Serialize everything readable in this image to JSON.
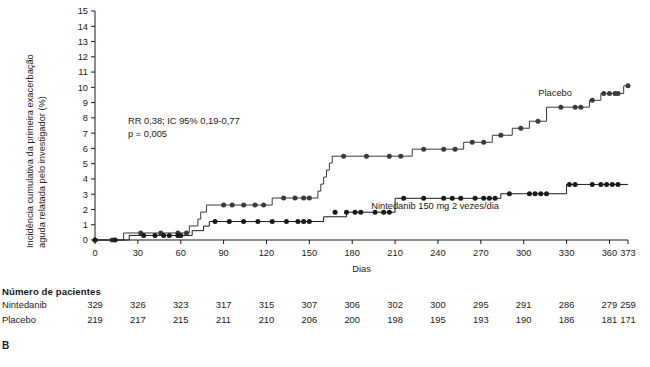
{
  "panel": {
    "letter": "B"
  },
  "axes": {
    "y_label_line1": "Incidência cumulativa da primeira exacerbação",
    "y_label_line2": "aguda relatada pelo investigador (%)",
    "x_label": "Dias"
  },
  "annotation": {
    "line1": "RR 0,38; IC 95% 0,19-0,77",
    "line2": "p = 0,005"
  },
  "series_labels": {
    "placebo": "Placebo",
    "nintedanib": "Nintedanib 150 mg 2 vezes/dia"
  },
  "risk_table": {
    "title": "Número de pacientes",
    "rows": [
      {
        "label": "Nintedanib",
        "values": [
          "329",
          "326",
          "323",
          "317",
          "315",
          "307",
          "306",
          "302",
          "300",
          "295",
          "291",
          "286",
          "279",
          "259"
        ]
      },
      {
        "label": "Placebo",
        "values": [
          "219",
          "217",
          "215",
          "211",
          "210",
          "206",
          "200",
          "198",
          "195",
          "193",
          "190",
          "186",
          "181",
          "171"
        ]
      }
    ]
  },
  "chart_data": {
    "type": "line",
    "title": "",
    "xlabel": "Dias",
    "ylabel": "Incidência cumulativa da primeira exacerbação aguda relatada pelo investigador (%)",
    "xlim": [
      0,
      373
    ],
    "ylim": [
      0,
      15
    ],
    "xticks": [
      0,
      30,
      60,
      90,
      120,
      150,
      180,
      210,
      240,
      270,
      300,
      330,
      360,
      373
    ],
    "xtick_labels": [
      "0",
      "30",
      "60",
      "90",
      "120",
      "150",
      "180",
      "210",
      "240",
      "270",
      "300",
      "330",
      "360",
      "373"
    ],
    "yticks": [
      0,
      1,
      2,
      3,
      4,
      5,
      6,
      7,
      8,
      9,
      10,
      11,
      12,
      13,
      14,
      15
    ],
    "ytick_labels": [
      "0",
      "1",
      "2",
      "3",
      "4",
      "5",
      "6",
      "7",
      "8",
      "9",
      "10",
      "11",
      "12",
      "13",
      "14",
      "15"
    ],
    "grid": false,
    "legend_position": "inline-annotation",
    "series": [
      {
        "name": "Placebo",
        "color": "#3a3a3a",
        "step": "post",
        "label_at": {
          "x": 322,
          "y": 9.4
        },
        "points": [
          [
            0,
            0.0
          ],
          [
            12,
            0.0
          ],
          [
            20,
            0.46
          ],
          [
            32,
            0.46
          ],
          [
            46,
            0.46
          ],
          [
            58,
            0.46
          ],
          [
            64,
            0.46
          ],
          [
            66,
            0.92
          ],
          [
            70,
            0.92
          ],
          [
            72,
            1.37
          ],
          [
            74,
            1.83
          ],
          [
            78,
            2.29
          ],
          [
            96,
            2.29
          ],
          [
            118,
            2.29
          ],
          [
            124,
            2.75
          ],
          [
            140,
            2.75
          ],
          [
            150,
            2.75
          ],
          [
            156,
            3.2
          ],
          [
            158,
            3.66
          ],
          [
            160,
            4.12
          ],
          [
            162,
            4.58
          ],
          [
            164,
            5.04
          ],
          [
            166,
            5.49
          ],
          [
            178,
            5.49
          ],
          [
            196,
            5.49
          ],
          [
            214,
            5.49
          ],
          [
            222,
            5.95
          ],
          [
            236,
            5.95
          ],
          [
            252,
            5.95
          ],
          [
            258,
            6.4
          ],
          [
            266,
            6.4
          ],
          [
            272,
            6.4
          ],
          [
            278,
            6.86
          ],
          [
            288,
            6.86
          ],
          [
            292,
            7.32
          ],
          [
            300,
            7.32
          ],
          [
            304,
            7.78
          ],
          [
            312,
            7.78
          ],
          [
            316,
            8.7
          ],
          [
            330,
            8.7
          ],
          [
            340,
            8.7
          ],
          [
            346,
            9.15
          ],
          [
            350,
            9.15
          ],
          [
            354,
            9.6
          ],
          [
            358,
            9.6
          ],
          [
            362,
            9.6
          ],
          [
            366,
            9.6
          ],
          [
            370,
            10.1
          ],
          [
            373,
            10.1
          ]
        ],
        "markers": [
          [
            0,
            0.0
          ],
          [
            12,
            0.0
          ],
          [
            32,
            0.46
          ],
          [
            46,
            0.46
          ],
          [
            58,
            0.46
          ],
          [
            64,
            0.46
          ],
          [
            90,
            2.29
          ],
          [
            96,
            2.29
          ],
          [
            104,
            2.29
          ],
          [
            112,
            2.29
          ],
          [
            118,
            2.29
          ],
          [
            132,
            2.75
          ],
          [
            140,
            2.75
          ],
          [
            146,
            2.75
          ],
          [
            150,
            2.75
          ],
          [
            174,
            5.49
          ],
          [
            190,
            5.49
          ],
          [
            206,
            5.49
          ],
          [
            214,
            5.49
          ],
          [
            230,
            5.95
          ],
          [
            244,
            5.95
          ],
          [
            252,
            5.95
          ],
          [
            264,
            6.4
          ],
          [
            272,
            6.4
          ],
          [
            284,
            6.86
          ],
          [
            298,
            7.32
          ],
          [
            310,
            7.78
          ],
          [
            326,
            8.7
          ],
          [
            336,
            8.7
          ],
          [
            340,
            8.7
          ],
          [
            348,
            9.15
          ],
          [
            356,
            9.6
          ],
          [
            360,
            9.6
          ],
          [
            364,
            9.6
          ],
          [
            366,
            9.6
          ],
          [
            373,
            10.1
          ]
        ]
      },
      {
        "name": "Nintedanib 150 mg 2 vezes/dia",
        "color": "#1a1a1a",
        "step": "post",
        "label_at": {
          "x": 238,
          "y": 2.0
        },
        "points": [
          [
            0,
            0.0
          ],
          [
            14,
            0.0
          ],
          [
            24,
            0.3
          ],
          [
            34,
            0.3
          ],
          [
            42,
            0.3
          ],
          [
            52,
            0.3
          ],
          [
            60,
            0.3
          ],
          [
            64,
            0.3
          ],
          [
            68,
            0.61
          ],
          [
            72,
            0.61
          ],
          [
            76,
            0.91
          ],
          [
            80,
            1.21
          ],
          [
            100,
            1.21
          ],
          [
            120,
            1.21
          ],
          [
            140,
            1.21
          ],
          [
            152,
            1.21
          ],
          [
            156,
            1.21
          ],
          [
            160,
            1.52
          ],
          [
            176,
            1.82
          ],
          [
            196,
            1.82
          ],
          [
            206,
            1.82
          ],
          [
            210,
            2.73
          ],
          [
            224,
            2.73
          ],
          [
            240,
            2.73
          ],
          [
            252,
            2.73
          ],
          [
            258,
            2.73
          ],
          [
            268,
            2.73
          ],
          [
            280,
            2.73
          ],
          [
            284,
            3.03
          ],
          [
            300,
            3.03
          ],
          [
            310,
            3.03
          ],
          [
            316,
            3.03
          ],
          [
            324,
            3.03
          ],
          [
            330,
            3.64
          ],
          [
            344,
            3.64
          ],
          [
            358,
            3.64
          ],
          [
            373,
            3.64
          ]
        ],
        "markers": [
          [
            0,
            0.0
          ],
          [
            14,
            0.0
          ],
          [
            34,
            0.3
          ],
          [
            42,
            0.3
          ],
          [
            48,
            0.3
          ],
          [
            52,
            0.3
          ],
          [
            58,
            0.3
          ],
          [
            60,
            0.3
          ],
          [
            84,
            1.21
          ],
          [
            94,
            1.21
          ],
          [
            104,
            1.21
          ],
          [
            114,
            1.21
          ],
          [
            124,
            1.21
          ],
          [
            134,
            1.21
          ],
          [
            142,
            1.21
          ],
          [
            146,
            1.21
          ],
          [
            150,
            1.21
          ],
          [
            168,
            1.82
          ],
          [
            176,
            1.82
          ],
          [
            182,
            1.82
          ],
          [
            186,
            1.82
          ],
          [
            196,
            1.82
          ],
          [
            202,
            1.82
          ],
          [
            206,
            1.82
          ],
          [
            216,
            2.73
          ],
          [
            230,
            2.73
          ],
          [
            244,
            2.73
          ],
          [
            250,
            2.73
          ],
          [
            256,
            2.73
          ],
          [
            266,
            2.73
          ],
          [
            272,
            2.73
          ],
          [
            276,
            2.73
          ],
          [
            280,
            2.73
          ],
          [
            290,
            3.03
          ],
          [
            304,
            3.03
          ],
          [
            308,
            3.03
          ],
          [
            312,
            3.03
          ],
          [
            316,
            3.03
          ],
          [
            332,
            3.64
          ],
          [
            336,
            3.64
          ],
          [
            348,
            3.64
          ],
          [
            354,
            3.64
          ],
          [
            358,
            3.64
          ],
          [
            362,
            3.64
          ],
          [
            366,
            3.64
          ]
        ]
      }
    ]
  }
}
